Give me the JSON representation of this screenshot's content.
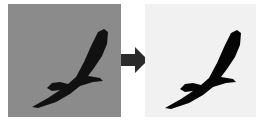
{
  "figure": {
    "left_panel": {
      "label": "",
      "background": "#8a8a8a",
      "subject": "bird-silhouette",
      "subject_color": "#111111"
    },
    "arrow": {
      "direction": "right",
      "color": "#2a2a2a"
    },
    "right_panel": {
      "label": "",
      "background": "#f1f1f1",
      "subject": "bird-silhouette",
      "subject_color": "#050505"
    }
  }
}
